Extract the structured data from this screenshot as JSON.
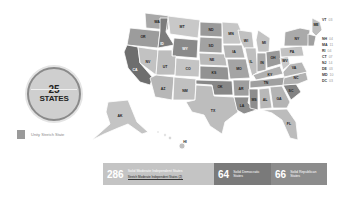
{
  "summary_circle": {
    "number": "25",
    "label": "STATES"
  },
  "legend": {
    "items": [
      {
        "label": "Unity Stretch State",
        "color": "#9a9a9a"
      }
    ]
  },
  "stats": [
    {
      "number": "286",
      "label": "Solid Moderate Independent States",
      "caption": "Stretch Moderate Independent States (2)",
      "color": "#c4c4c4"
    },
    {
      "number": "64",
      "label": "Solid Democratic States",
      "color": "#7a7a7a"
    },
    {
      "number": "66",
      "label": "Solid Republican States",
      "color": "#8c8c8c"
    }
  ],
  "small_state_labels": [
    {
      "abbr": "VT",
      "value": "03"
    },
    {
      "abbr": "NH",
      "value": "04"
    },
    {
      "abbr": "MA",
      "value": "11"
    },
    {
      "abbr": "RI",
      "value": "04"
    },
    {
      "abbr": "CT",
      "value": "07"
    },
    {
      "abbr": "NJ",
      "value": "14"
    },
    {
      "abbr": "DE",
      "value": "03"
    },
    {
      "abbr": "MD",
      "value": "10"
    },
    {
      "abbr": "DC",
      "value": "03"
    }
  ],
  "states": [
    {
      "abbr": "WA",
      "shade": "#a8a8a8"
    },
    {
      "abbr": "OR",
      "shade": "#9c9c9c"
    },
    {
      "abbr": "CA",
      "shade": "#6e6e6e"
    },
    {
      "abbr": "NV",
      "shade": "#c2c2c2"
    },
    {
      "abbr": "ID",
      "shade": "#7c7c7c"
    },
    {
      "abbr": "MT",
      "shade": "#c8c8c8"
    },
    {
      "abbr": "WY",
      "shade": "#8a8a8a"
    },
    {
      "abbr": "UT",
      "shade": "#bdbdbd"
    },
    {
      "abbr": "AZ",
      "shade": "#b7b7b7"
    },
    {
      "abbr": "CO",
      "shade": "#c4c4c4"
    },
    {
      "abbr": "NM",
      "shade": "#c0c0c0"
    },
    {
      "abbr": "ND",
      "shade": "#9a9a9a"
    },
    {
      "abbr": "SD",
      "shade": "#a2a2a2"
    },
    {
      "abbr": "NE",
      "shade": "#bababa"
    },
    {
      "abbr": "KS",
      "shade": "#929292"
    },
    {
      "abbr": "OK",
      "shade": "#888888"
    },
    {
      "abbr": "TX",
      "shade": "#bdbdbd"
    },
    {
      "abbr": "MN",
      "shade": "#c6c6c6"
    },
    {
      "abbr": "IA",
      "shade": "#b5b5b5"
    },
    {
      "abbr": "MO",
      "shade": "#a4a4a4"
    },
    {
      "abbr": "AR",
      "shade": "#9e9e9e"
    },
    {
      "abbr": "LA",
      "shade": "#8e8e8e"
    },
    {
      "abbr": "WI",
      "shade": "#c1c1c1"
    },
    {
      "abbr": "IL",
      "shade": "#bfbfbf"
    },
    {
      "abbr": "MI",
      "shade": "#c3c3c3"
    },
    {
      "abbr": "IN",
      "shade": "#a9a9a9"
    },
    {
      "abbr": "OH",
      "shade": "#9a9a9a"
    },
    {
      "abbr": "KY",
      "shade": "#b0b0b0"
    },
    {
      "abbr": "TN",
      "shade": "#a0a0a0"
    },
    {
      "abbr": "MS",
      "shade": "#8e8e8e"
    },
    {
      "abbr": "AL",
      "shade": "#b8b8b8"
    },
    {
      "abbr": "GA",
      "shade": "#b4b4b4"
    },
    {
      "abbr": "FL",
      "shade": "#bcbcbc"
    },
    {
      "abbr": "SC",
      "shade": "#828282"
    },
    {
      "abbr": "NC",
      "shade": "#b2b2b2"
    },
    {
      "abbr": "VA",
      "shade": "#b6b6b6"
    },
    {
      "abbr": "WV",
      "shade": "#c9c9c9"
    },
    {
      "abbr": "PA",
      "shade": "#c2c2c2"
    },
    {
      "abbr": "NY",
      "shade": "#aaaaaa"
    },
    {
      "abbr": "ME",
      "shade": "#bdbdbd"
    },
    {
      "abbr": "AK",
      "shade": "#c4c4c4"
    },
    {
      "abbr": "HI",
      "shade": "#c0c0c0"
    }
  ]
}
